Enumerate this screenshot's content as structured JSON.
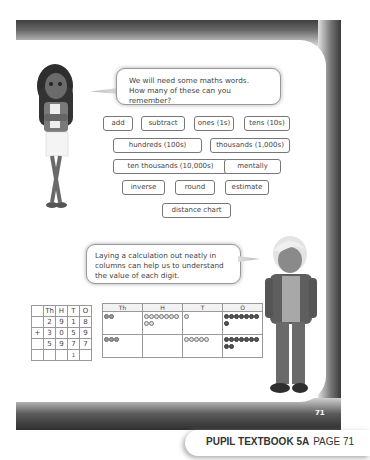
{
  "speech_bubbles": {
    "top": {
      "line1": "We will need some maths words.",
      "line2": "How many of these can you remember?"
    },
    "bottom": {
      "line1": "Laying a calculation out neatly in",
      "line2": "columns can help us to understand",
      "line3": "the value of each digit."
    }
  },
  "word_tags": [
    {
      "label": "add"
    },
    {
      "label": "subtract"
    },
    {
      "label": "ones (1s)"
    },
    {
      "label": "tens (10s)"
    },
    {
      "label": "hundreds (100s)"
    },
    {
      "label": "thousands (1,000s)"
    },
    {
      "label": "ten thousands (10,000s)"
    },
    {
      "label": "mentally"
    },
    {
      "label": "inverse"
    },
    {
      "label": "round"
    },
    {
      "label": "estimate"
    },
    {
      "label": "distance chart"
    }
  ],
  "column_addition": {
    "headers": [
      "Th",
      "H",
      "T",
      "O"
    ],
    "row1": {
      "sign": "",
      "digits": [
        "2",
        "9",
        "1",
        "8"
      ]
    },
    "row2": {
      "sign": "+",
      "digits": [
        "3",
        "0",
        "5",
        "9"
      ]
    },
    "result": {
      "sign": "",
      "digits": [
        "5",
        "9",
        "7",
        "7"
      ]
    },
    "carry": {
      "sign": "",
      "digits": [
        "",
        "",
        "1",
        ""
      ]
    }
  },
  "place_value_chart": {
    "headers": [
      "Th",
      "H",
      "T",
      "O"
    ],
    "rows": [
      {
        "Th": 2,
        "H": 9,
        "T": 1,
        "O": 8
      },
      {
        "Th": 3,
        "H": 0,
        "T": 5,
        "O": 9
      }
    ]
  },
  "page": {
    "number": "71"
  },
  "footer": {
    "book": "PUPIL TEXTBOOK 5A",
    "page_label": "PAGE 71"
  }
}
